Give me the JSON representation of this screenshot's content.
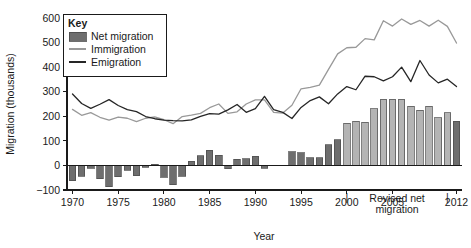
{
  "chart_data": {
    "type": "bar",
    "title": "",
    "xlabel": "Year",
    "ylabel": "Migration (thousands)",
    "ylim": [
      -100,
      600
    ],
    "xlim": [
      1969.4,
      2012.6
    ],
    "ytick_labels": [
      "600",
      "500",
      "400",
      "300",
      "200",
      "100",
      "0",
      "-100"
    ],
    "ytick_values": [
      600,
      500,
      400,
      300,
      200,
      100,
      0,
      -100
    ],
    "xtick_labels": [
      "1970",
      "1975",
      "1980",
      "1985",
      "1990",
      "1995",
      "2000",
      "2005",
      "2012"
    ],
    "xtick_values": [
      1970,
      1975,
      1980,
      1985,
      1990,
      1995,
      2000,
      2005,
      2012
    ],
    "grid": false,
    "legend_position": "top-left",
    "legend_title": "Key",
    "categories": [
      1970,
      1971,
      1972,
      1973,
      1974,
      1975,
      1976,
      1977,
      1978,
      1979,
      1980,
      1981,
      1982,
      1983,
      1984,
      1985,
      1986,
      1987,
      1988,
      1989,
      1990,
      1991,
      1992,
      1993,
      1994,
      1995,
      1996,
      1997,
      1998,
      1999,
      2000,
      2001,
      2002,
      2003,
      2004,
      2005,
      2006,
      2007,
      2008,
      2009,
      2010,
      2011,
      2012
    ],
    "series": [
      {
        "name": "Net migration",
        "type": "bar",
        "color": "#6e6e6e",
        "values": [
          -63,
          -44,
          -12,
          -54,
          -86,
          -47,
          -19,
          -41,
          -7,
          4,
          -48,
          -78,
          -45,
          17,
          40,
          62,
          41,
          -14,
          25,
          28,
          37,
          -11,
          0,
          0,
          56,
          52,
          32,
          31,
          84,
          104,
          172,
          180,
          176,
          230,
          270,
          270,
          270,
          240,
          225,
          240,
          195,
          215,
          180
        ]
      },
      {
        "name": "Immigration",
        "type": "line",
        "color": "#999999",
        "values": [
          228,
          204,
          215,
          196,
          184,
          197,
          192,
          178,
          192,
          198,
          186,
          170,
          199,
          205,
          212,
          235,
          250,
          212,
          218,
          250,
          267,
          267,
          216,
          213,
          245,
          312,
          318,
          327,
          391,
          454,
          479,
          481,
          516,
          511,
          589,
          567,
          596,
          574,
          590,
          567,
          591,
          566,
          498
        ]
      },
      {
        "name": "Emigration",
        "type": "line",
        "color": "#262626",
        "values": [
          291,
          252,
          232,
          249,
          268,
          244,
          227,
          219,
          199,
          190,
          184,
          182,
          181,
          185,
          200,
          211,
          209,
          226,
          248,
          216,
          231,
          281,
          227,
          216,
          191,
          236,
          264,
          279,
          251,
          291,
          321,
          308,
          363,
          361,
          344,
          361,
          400,
          341,
          427,
          368,
          336,
          351,
          321
        ]
      }
    ],
    "annotations": [
      {
        "text_line1": "Revised net",
        "text_line2": "migration",
        "range_start": 2000,
        "range_end": 2011,
        "marker": "|"
      }
    ]
  },
  "legend": {
    "title": "Key",
    "items": [
      {
        "label": "Net migration",
        "marker": "swatch"
      },
      {
        "label": "Immigration",
        "marker": "line-light"
      },
      {
        "label": "Emigration",
        "marker": "line-dark"
      }
    ]
  },
  "colors": {
    "bar": "#6e6e6e",
    "bar_revised": "#b4b4b4",
    "immigration": "#999999",
    "emigration": "#262626",
    "axis": "#1a1a1a",
    "background": "#ffffff"
  }
}
